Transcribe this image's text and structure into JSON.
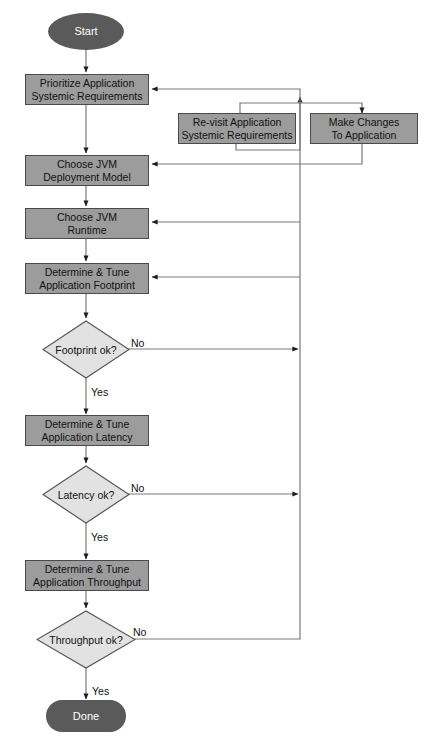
{
  "diagram": {
    "colors": {
      "terminator_fill": "#5a5a5a",
      "terminator_text": "#ffffff",
      "process_fill": "#9c9c9c",
      "process_stroke": "#4a4a4a",
      "decision_fill": "#e2e2e2",
      "decision_stroke": "#555555",
      "connector": "#6f6f6f",
      "background": "#ffffff"
    },
    "nodes": {
      "start": {
        "label": "Start",
        "shape": "ellipse"
      },
      "prioritize": {
        "line1": "Prioritize Application",
        "line2": "Systemic Requirements",
        "shape": "process"
      },
      "revisit": {
        "line1": "Re-visit Application",
        "line2": "Systemic Requirements",
        "shape": "process"
      },
      "make_changes": {
        "line1": "Make Changes",
        "line2": "To Application",
        "shape": "process"
      },
      "choose_model": {
        "line1": "Choose JVM",
        "line2": "Deployment Model",
        "shape": "process"
      },
      "choose_runtime": {
        "line1": "Choose JVM",
        "line2": "Runtime",
        "shape": "process"
      },
      "tune_footprint": {
        "line1": "Determine & Tune",
        "line2": "Application Footprint",
        "shape": "process"
      },
      "footprint_ok": {
        "label": "Footprint ok?",
        "shape": "decision"
      },
      "tune_latency": {
        "line1": "Determine & Tune",
        "line2": "Application Latency",
        "shape": "process"
      },
      "latency_ok": {
        "label": "Latency ok?",
        "shape": "decision"
      },
      "tune_throughput": {
        "line1": "Determine & Tune",
        "line2": "Application Throughput",
        "shape": "process"
      },
      "throughput_ok": {
        "label": "Throughput ok?",
        "shape": "decision"
      },
      "done": {
        "label": "Done",
        "shape": "stadium"
      }
    },
    "edge_labels": {
      "footprint_no": "No",
      "footprint_yes": "Yes",
      "latency_no": "No",
      "latency_yes": "Yes",
      "throughput_no": "No",
      "throughput_yes": "Yes"
    }
  }
}
